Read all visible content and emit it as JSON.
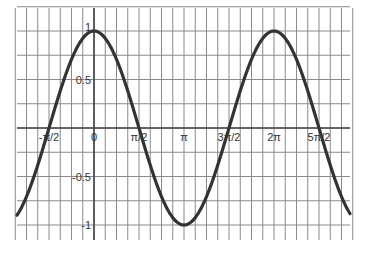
{
  "chart_data": {
    "type": "line",
    "title": "",
    "xlabel": "",
    "ylabel": "",
    "function": "y = cos(x)",
    "x_tick_labels": [
      "-π/2",
      "0",
      "π/2",
      "π",
      "3π/2",
      "2π",
      "5π/2"
    ],
    "x_tick_values": [
      -1.5708,
      0,
      1.5708,
      3.1416,
      4.7124,
      6.2832,
      7.854
    ],
    "y_tick_labels": [
      "1",
      "0.5",
      "-0.5",
      "-1"
    ],
    "y_tick_values": [
      1,
      0.5,
      -0.5,
      -1
    ],
    "xlim": [
      -2.75,
      9.1
    ],
    "ylim": [
      -1.13,
      1.24
    ],
    "grid": true,
    "grid_minor_x_step": "π/8",
    "grid_minor_y_step": 0.25,
    "legend": null,
    "series": [
      {
        "name": "cos(x)",
        "color": "#333333",
        "x": [
          -2.75,
          -1.5708,
          0,
          1.5708,
          3.1416,
          4.7124,
          6.2832,
          7.854,
          9.1
        ],
        "values": [
          -0.92,
          0,
          1,
          0,
          -1,
          0,
          1,
          0,
          -0.95
        ]
      }
    ]
  },
  "colors": {
    "grid": "#8a8a8a",
    "axis": "#444444",
    "curve": "#333333",
    "background": "#ffffff"
  }
}
